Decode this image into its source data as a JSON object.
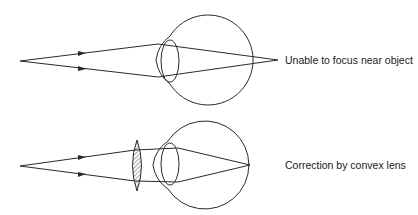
{
  "diagram": {
    "type": "ray-optics",
    "panels": [
      {
        "id": "uncorrected",
        "caption": "Unable to focus near object",
        "object_point": [
          20,
          61
        ],
        "eye_center": [
          210,
          60
        ],
        "eye_radius": 45,
        "focus_point": [
          278,
          60
        ]
      },
      {
        "id": "corrected",
        "caption": "Correction by convex lens",
        "object_point": [
          20,
          166
        ],
        "corrective_lens": "convex lens (hatched)",
        "eye_center": [
          207,
          165
        ],
        "eye_radius": 44,
        "focus_point": [
          250,
          165
        ]
      }
    ],
    "colors": {
      "line": "#2a2a2a",
      "hatch": "#6a6a6a",
      "background": "#ffffff"
    }
  }
}
